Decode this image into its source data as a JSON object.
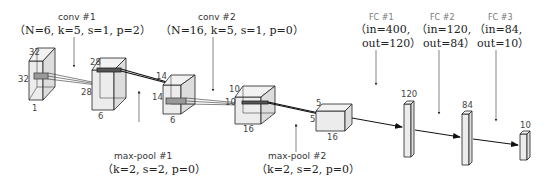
{
  "colors": {
    "box_fill": "#e8e8e8",
    "box_stroke": "#222222",
    "arrow": "#111111",
    "text": "#222222"
  },
  "layers": {
    "conv1": {
      "title": "conv #1",
      "params": "（N=6, k=5, s=1, p=2）",
      "N": 6,
      "k": 5,
      "s": 1,
      "p": 2
    },
    "conv2": {
      "title": "conv #2",
      "params": "（N=16, k=5, s=1, p=0）",
      "N": 16,
      "k": 5,
      "s": 1,
      "p": 0
    },
    "pool1": {
      "title": "max-pool #1",
      "params": "（k=2, s=2, p=0）",
      "k": 2,
      "s": 2,
      "p": 0
    },
    "pool2": {
      "title": "max-pool #2",
      "params": "（k=2, s=2, p=0）",
      "k": 2,
      "s": 2,
      "p": 0
    },
    "fc1": {
      "title": "FC #1",
      "line1": "（in=400,",
      "line2": "out=120）",
      "in": 400,
      "out": 120
    },
    "fc2": {
      "title": "FC #2",
      "line1": "（in=120,",
      "line2": "out=84）",
      "in": 120,
      "out": 84
    },
    "fc3": {
      "title": "FC #3",
      "line1": "（in=84,",
      "line2": "out=10）",
      "in": 84,
      "out": 10
    }
  },
  "volumes": [
    {
      "name": "input",
      "h": "32",
      "w": "32",
      "d": "1"
    },
    {
      "name": "conv1-out",
      "h": "28",
      "w": "28",
      "d": "6"
    },
    {
      "name": "pool1-out",
      "h": "14",
      "w": "14",
      "d": "6"
    },
    {
      "name": "conv2-out",
      "h": "10",
      "w": "10",
      "d": "16"
    },
    {
      "name": "pool2-out",
      "h": "5",
      "w": "5",
      "d": "16"
    },
    {
      "name": "fc1-out",
      "size": "120"
    },
    {
      "name": "fc2-out",
      "size": "84"
    },
    {
      "name": "fc3-out",
      "size": "10"
    }
  ]
}
